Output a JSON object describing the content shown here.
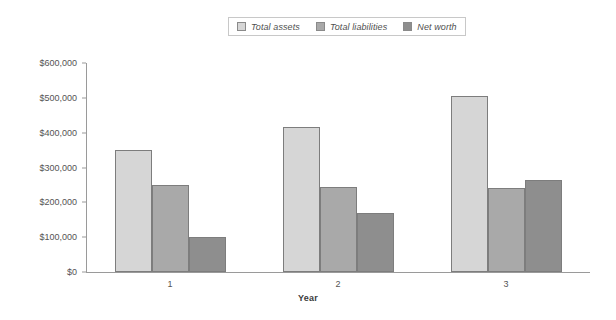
{
  "chart_data": {
    "type": "bar",
    "title": "",
    "subtitle": "",
    "xlabel": "Year",
    "ylabel": "",
    "categories": [
      "1",
      "2",
      "3"
    ],
    "series": [
      {
        "name": "Total assets",
        "values": [
          350000,
          415000,
          505000
        ],
        "color": "#d6d6d6"
      },
      {
        "name": "Total liabilities",
        "values": [
          250000,
          245000,
          240000
        ],
        "color": "#a9a9a9"
      },
      {
        "name": "Net worth",
        "values": [
          100000,
          170000,
          265000
        ],
        "color": "#8e8e8e"
      }
    ],
    "ylim": [
      0,
      600000
    ],
    "yticks": [
      0,
      100000,
      200000,
      300000,
      400000,
      500000,
      600000
    ],
    "ytick_labels": [
      "$0",
      "$100,000",
      "$200,000",
      "$300,000",
      "$400,000",
      "$500,000",
      "$600,000"
    ],
    "grid": false,
    "legend_position": "top-center",
    "orientation": "vertical",
    "bar_border_color": "#7d7d7d",
    "axis_color": "#9a9a9a"
  },
  "legend": {
    "entries": [
      {
        "label": "Total assets"
      },
      {
        "label": "Total liabilities"
      },
      {
        "label": "Net worth"
      }
    ]
  }
}
